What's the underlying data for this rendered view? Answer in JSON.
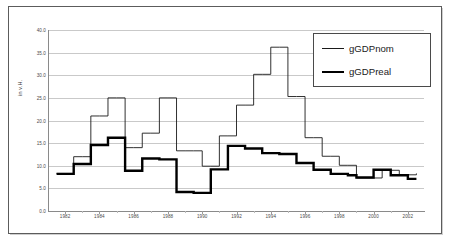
{
  "figure": {
    "bleed_text": "·  ·   ·",
    "y_axis_title": "in v.H."
  },
  "legend": {
    "position": "top-right-inside",
    "entries": [
      {
        "label": "gGDPnom",
        "style": "thin-line",
        "color": "#1a1a1a"
      },
      {
        "label": "gGDPreal",
        "style": "thick-line",
        "color": "#000000"
      }
    ]
  },
  "chart_data": {
    "type": "line",
    "title": "",
    "subtitle": "",
    "xlabel": "",
    "ylabel": "in v.H.",
    "grid": true,
    "legend_position": "upper right",
    "xlim": [
      1981,
      2003
    ],
    "ylim": [
      0.0,
      40.0
    ],
    "ytick_labels": [
      "0.0",
      "5.0",
      "10.0",
      "15.0",
      "20.0",
      "25.0",
      "30.0",
      "35.0",
      "40.0"
    ],
    "yticks": [
      0.0,
      5.0,
      10.0,
      15.0,
      20.0,
      25.0,
      30.0,
      35.0,
      40.0
    ],
    "xtick_labels": [
      "1982",
      "1984",
      "1986",
      "1988",
      "1990",
      "1992",
      "1994",
      "1996",
      "1998",
      "2000",
      "2002"
    ],
    "xticks": [
      1982,
      1984,
      1986,
      1988,
      1990,
      1992,
      1994,
      1996,
      1998,
      2000,
      2002
    ],
    "x": [
      1981.5,
      1982.0,
      1982.5,
      1983.0,
      1983.5,
      1984.0,
      1984.5,
      1985.0,
      1985.5,
      1986.0,
      1986.5,
      1987.0,
      1987.5,
      1988.0,
      1988.5,
      1989.0,
      1989.5,
      1990.0,
      1990.5,
      1991.0,
      1991.5,
      1992.0,
      1992.5,
      1993.0,
      1993.5,
      1994.0,
      1994.5,
      1995.0,
      1995.5,
      1996.0,
      1996.5,
      1997.0,
      1997.5,
      1998.0,
      1998.5,
      1999.0,
      1999.5,
      2000.0,
      2000.5,
      2001.0,
      2001.5,
      2002.0,
      2002.5
    ],
    "series": [
      {
        "name": "gGDPnom",
        "style": "thin-line",
        "color": "#1a1a1a",
        "values": [
          8.3,
          8.3,
          12.0,
          12.0,
          21.0,
          21.0,
          25.0,
          25.0,
          14.0,
          14.0,
          17.2,
          17.2,
          25.0,
          25.0,
          13.3,
          13.3,
          13.3,
          9.9,
          9.9,
          16.6,
          16.6,
          23.4,
          23.4,
          30.2,
          30.2,
          36.2,
          36.2,
          25.3,
          25.3,
          16.2,
          16.2,
          12.1,
          12.1,
          10.1,
          10.1,
          7.3,
          7.3,
          7.3,
          9.0,
          9.0,
          8.0,
          8.0,
          8.3
        ]
      },
      {
        "name": "gGDPreal",
        "style": "thick-line",
        "color": "#000000",
        "values": [
          8.2,
          8.2,
          10.4,
          10.4,
          14.6,
          14.6,
          16.2,
          16.2,
          8.9,
          8.9,
          11.6,
          11.6,
          11.4,
          11.4,
          4.2,
          4.2,
          4.0,
          4.0,
          9.2,
          9.2,
          14.4,
          14.4,
          13.8,
          13.8,
          12.8,
          12.8,
          12.6,
          12.6,
          10.6,
          10.6,
          9.1,
          9.1,
          8.2,
          8.2,
          7.9,
          7.4,
          7.4,
          9.1,
          9.1,
          7.9,
          7.9,
          7.1,
          7.1
        ]
      }
    ]
  }
}
